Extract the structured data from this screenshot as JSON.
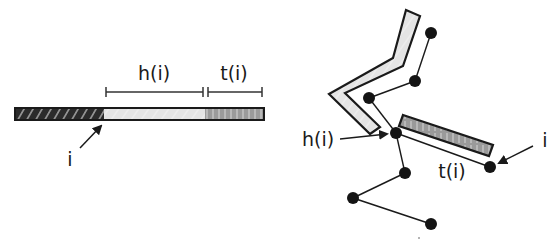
{
  "colors": {
    "ink": "#1a1a1a",
    "dark_segment": "#2b2b2b",
    "light_segment": "#e2e2e2",
    "mid_segment": "#9a9a9a",
    "node": "#141414"
  },
  "left_panel": {
    "bar": {
      "segments": [
        {
          "name": "prefix",
          "fill": "dark-hatched",
          "x_start": 15,
          "x_end": 104
        },
        {
          "name": "head",
          "fill": "light-gray",
          "x_start": 104,
          "x_end": 205
        },
        {
          "name": "tail",
          "fill": "mid-gray-hatched",
          "x_start": 205,
          "x_end": 264
        }
      ]
    },
    "brackets": [
      {
        "label": "h(i)",
        "x_start": 106,
        "x_end": 203
      },
      {
        "label": "t(i)",
        "x_start": 208,
        "x_end": 262
      }
    ],
    "labels": {
      "head": "h(i)",
      "tail": "t(i)",
      "index": "i"
    }
  },
  "right_panel": {
    "labels": {
      "head": "h(i)",
      "tail": "t(i)",
      "index": "i"
    },
    "nodes": [
      {
        "id": "n1",
        "x": 431,
        "y": 33
      },
      {
        "id": "n2",
        "x": 415,
        "y": 81
      },
      {
        "id": "n3",
        "x": 369,
        "y": 98
      },
      {
        "id": "n4",
        "x": 396,
        "y": 133
      },
      {
        "id": "n5",
        "x": 405,
        "y": 173
      },
      {
        "id": "n6",
        "x": 353,
        "y": 198
      },
      {
        "id": "n7",
        "x": 431,
        "y": 224
      },
      {
        "id": "n8",
        "x": 490,
        "y": 167
      }
    ],
    "edges": [
      [
        "n1",
        "n2"
      ],
      [
        "n2",
        "n3"
      ],
      [
        "n3",
        "n4"
      ],
      [
        "n4",
        "n5"
      ],
      [
        "n5",
        "n6"
      ],
      [
        "n6",
        "n7"
      ],
      [
        "n4",
        "n8"
      ]
    ]
  }
}
